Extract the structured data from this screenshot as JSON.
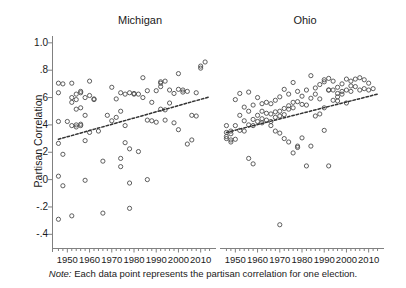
{
  "figure": {
    "width": 406,
    "height": 288,
    "background": "#ffffff",
    "marker_color": "#4d4d4d",
    "axis_color": "#808080",
    "fit_line_color": "#333333",
    "note_prefix": "Note:",
    "note_text": " Each data point represents the partisan correlation for one election."
  },
  "axes": {
    "y_title": "Partisan Correlation",
    "y_ticks": [
      "1.0",
      ".8",
      ".6",
      ".4",
      ".2",
      ".0",
      "-.2",
      "-.4"
    ],
    "y_tick_values": [
      1.0,
      0.8,
      0.6,
      0.4,
      0.2,
      0.0,
      -0.2,
      -0.4
    ],
    "y_range": [
      -0.5,
      1.05
    ],
    "x_ticks": [
      "1950",
      "1960",
      "1970",
      "1980",
      "1990",
      "2000",
      "2010"
    ],
    "x_tick_values": [
      1950,
      1960,
      1970,
      1980,
      1990,
      2000,
      2010
    ],
    "x_range": [
      1944,
      2016
    ],
    "x_minor_step": 2,
    "grid": false
  },
  "chart_data": {
    "type": "scatter",
    "title": "",
    "subtitle": "",
    "xlabel": "",
    "ylabel": "Partisan Correlation",
    "xlim": [
      1944,
      2016
    ],
    "ylim": [
      -0.5,
      1.05
    ],
    "grid": false,
    "legend": "none",
    "annotations": [
      "Note: Each data point represents the partisan correlation for one election."
    ],
    "panels": [
      {
        "name": "Michigan",
        "fit_line": {
          "type": "linear-dashed",
          "x": [
            1946,
            2014
          ],
          "y": [
            0.295,
            0.605
          ]
        },
        "points": [
          {
            "x": 1946,
            "y": 0.705
          },
          {
            "x": 1946,
            "y": 0.635
          },
          {
            "x": 1946,
            "y": 0.425
          },
          {
            "x": 1946,
            "y": 0.265
          },
          {
            "x": 1946,
            "y": 0.025
          },
          {
            "x": 1946,
            "y": -0.29
          },
          {
            "x": 1948,
            "y": 0.7
          },
          {
            "x": 1948,
            "y": 0.185
          },
          {
            "x": 1948,
            "y": -0.045
          },
          {
            "x": 1950,
            "y": 0.425
          },
          {
            "x": 1952,
            "y": 0.705
          },
          {
            "x": 1952,
            "y": 0.6
          },
          {
            "x": 1952,
            "y": 0.565
          },
          {
            "x": 1952,
            "y": 0.395
          },
          {
            "x": 1952,
            "y": -0.265
          },
          {
            "x": 1954,
            "y": 0.625
          },
          {
            "x": 1954,
            "y": 0.585
          },
          {
            "x": 1954,
            "y": 0.515
          },
          {
            "x": 1954,
            "y": 0.4
          },
          {
            "x": 1954,
            "y": 0.385
          },
          {
            "x": 1956,
            "y": 0.645
          },
          {
            "x": 1956,
            "y": 0.635
          },
          {
            "x": 1956,
            "y": 0.525
          },
          {
            "x": 1956,
            "y": 0.405
          },
          {
            "x": 1956,
            "y": 0.395
          },
          {
            "x": 1958,
            "y": 0.6
          },
          {
            "x": 1958,
            "y": 0.47
          },
          {
            "x": 1958,
            "y": 0.285
          },
          {
            "x": 1958,
            "y": -0.005
          },
          {
            "x": 1960,
            "y": 0.72
          },
          {
            "x": 1960,
            "y": 0.615
          },
          {
            "x": 1960,
            "y": 0.345
          },
          {
            "x": 1962,
            "y": 0.59
          },
          {
            "x": 1962,
            "y": 0.585
          },
          {
            "x": 1964,
            "y": 0.355
          },
          {
            "x": 1966,
            "y": 0.135
          },
          {
            "x": 1966,
            "y": -0.245
          },
          {
            "x": 1968,
            "y": 0.47
          },
          {
            "x": 1970,
            "y": 0.675
          },
          {
            "x": 1970,
            "y": 0.43
          },
          {
            "x": 1972,
            "y": 0.59
          },
          {
            "x": 1972,
            "y": 0.455
          },
          {
            "x": 1974,
            "y": 0.635
          },
          {
            "x": 1974,
            "y": 0.5
          },
          {
            "x": 1974,
            "y": 0.155
          },
          {
            "x": 1974,
            "y": 0.095
          },
          {
            "x": 1976,
            "y": 0.625
          },
          {
            "x": 1976,
            "y": 0.395
          },
          {
            "x": 1976,
            "y": 0.27
          },
          {
            "x": 1978,
            "y": 0.635
          },
          {
            "x": 1978,
            "y": 0.225
          },
          {
            "x": 1978,
            "y": -0.025
          },
          {
            "x": 1978,
            "y": -0.21
          },
          {
            "x": 1980,
            "y": 0.63
          },
          {
            "x": 1980,
            "y": 0.625
          },
          {
            "x": 1982,
            "y": 0.625
          },
          {
            "x": 1982,
            "y": 0.205
          },
          {
            "x": 1984,
            "y": 0.745
          },
          {
            "x": 1984,
            "y": 0.6
          },
          {
            "x": 1986,
            "y": 0.65
          },
          {
            "x": 1986,
            "y": 0.435
          },
          {
            "x": 1986,
            "y": 0.0
          },
          {
            "x": 1988,
            "y": 0.565
          },
          {
            "x": 1988,
            "y": 0.43
          },
          {
            "x": 1990,
            "y": 0.65
          },
          {
            "x": 1990,
            "y": 0.42
          },
          {
            "x": 1992,
            "y": 0.715
          },
          {
            "x": 1992,
            "y": 0.705
          },
          {
            "x": 1992,
            "y": 0.68
          },
          {
            "x": 1992,
            "y": 0.515
          },
          {
            "x": 1994,
            "y": 0.72
          },
          {
            "x": 1994,
            "y": 0.51
          },
          {
            "x": 1994,
            "y": 0.435
          },
          {
            "x": 1996,
            "y": 0.655
          },
          {
            "x": 1996,
            "y": 0.56
          },
          {
            "x": 1998,
            "y": 0.63
          },
          {
            "x": 1998,
            "y": 0.415
          },
          {
            "x": 2000,
            "y": 0.775
          },
          {
            "x": 2000,
            "y": 0.66
          },
          {
            "x": 2000,
            "y": 0.365
          },
          {
            "x": 2002,
            "y": 0.655
          },
          {
            "x": 2002,
            "y": 0.64
          },
          {
            "x": 2004,
            "y": 0.645
          },
          {
            "x": 2004,
            "y": 0.26
          },
          {
            "x": 2006,
            "y": 0.47
          },
          {
            "x": 2006,
            "y": 0.29
          },
          {
            "x": 2008,
            "y": 0.635
          },
          {
            "x": 2008,
            "y": 0.465
          },
          {
            "x": 2010,
            "y": 0.83
          },
          {
            "x": 2010,
            "y": 0.815
          },
          {
            "x": 2012,
            "y": 0.86
          }
        ]
      },
      {
        "name": "Ohio",
        "fit_line": {
          "type": "linear-dashed",
          "x": [
            1946,
            2014
          ],
          "y": [
            0.345,
            0.625
          ]
        },
        "points": [
          {
            "x": 1946,
            "y": 0.395
          },
          {
            "x": 1946,
            "y": 0.345
          },
          {
            "x": 1946,
            "y": 0.315
          },
          {
            "x": 1946,
            "y": 0.3
          },
          {
            "x": 1948,
            "y": 0.355
          },
          {
            "x": 1948,
            "y": 0.335
          },
          {
            "x": 1948,
            "y": 0.29
          },
          {
            "x": 1948,
            "y": 0.275
          },
          {
            "x": 1950,
            "y": 0.585
          },
          {
            "x": 1950,
            "y": 0.395
          },
          {
            "x": 1950,
            "y": 0.295
          },
          {
            "x": 1952,
            "y": 0.63
          },
          {
            "x": 1952,
            "y": 0.47
          },
          {
            "x": 1952,
            "y": 0.36
          },
          {
            "x": 1954,
            "y": 0.53
          },
          {
            "x": 1954,
            "y": 0.43
          },
          {
            "x": 1954,
            "y": 0.355
          },
          {
            "x": 1956,
            "y": 0.64
          },
          {
            "x": 1956,
            "y": 0.5
          },
          {
            "x": 1956,
            "y": 0.4
          },
          {
            "x": 1956,
            "y": 0.155
          },
          {
            "x": 1958,
            "y": 0.545
          },
          {
            "x": 1958,
            "y": 0.44
          },
          {
            "x": 1958,
            "y": 0.395
          },
          {
            "x": 1958,
            "y": 0.115
          },
          {
            "x": 1960,
            "y": 0.6
          },
          {
            "x": 1960,
            "y": 0.47
          },
          {
            "x": 1960,
            "y": 0.425
          },
          {
            "x": 1962,
            "y": 0.555
          },
          {
            "x": 1962,
            "y": 0.5
          },
          {
            "x": 1962,
            "y": 0.445
          },
          {
            "x": 1962,
            "y": 0.415
          },
          {
            "x": 1964,
            "y": 0.565
          },
          {
            "x": 1964,
            "y": 0.485
          },
          {
            "x": 1964,
            "y": 0.435
          },
          {
            "x": 1966,
            "y": 0.555
          },
          {
            "x": 1966,
            "y": 0.48
          },
          {
            "x": 1966,
            "y": 0.425
          },
          {
            "x": 1966,
            "y": 0.395
          },
          {
            "x": 1968,
            "y": 0.58
          },
          {
            "x": 1968,
            "y": 0.495
          },
          {
            "x": 1968,
            "y": 0.455
          },
          {
            "x": 1968,
            "y": 0.355
          },
          {
            "x": 1970,
            "y": 0.605
          },
          {
            "x": 1970,
            "y": 0.5
          },
          {
            "x": 1970,
            "y": 0.465
          },
          {
            "x": 1970,
            "y": 0.34
          },
          {
            "x": 1970,
            "y": -0.33
          },
          {
            "x": 1972,
            "y": 0.66
          },
          {
            "x": 1972,
            "y": 0.52
          },
          {
            "x": 1972,
            "y": 0.475
          },
          {
            "x": 1972,
            "y": 0.3
          },
          {
            "x": 1974,
            "y": 0.625
          },
          {
            "x": 1974,
            "y": 0.54
          },
          {
            "x": 1974,
            "y": 0.515
          },
          {
            "x": 1974,
            "y": 0.275
          },
          {
            "x": 1976,
            "y": 0.71
          },
          {
            "x": 1976,
            "y": 0.565
          },
          {
            "x": 1976,
            "y": 0.525
          },
          {
            "x": 1976,
            "y": 0.195
          },
          {
            "x": 1978,
            "y": 0.645
          },
          {
            "x": 1978,
            "y": 0.57
          },
          {
            "x": 1978,
            "y": 0.245
          },
          {
            "x": 1978,
            "y": 0.235
          },
          {
            "x": 1980,
            "y": 0.61
          },
          {
            "x": 1980,
            "y": 0.55
          },
          {
            "x": 1980,
            "y": 0.305
          },
          {
            "x": 1982,
            "y": 0.655
          },
          {
            "x": 1982,
            "y": 0.545
          },
          {
            "x": 1982,
            "y": 0.1
          },
          {
            "x": 1984,
            "y": 0.76
          },
          {
            "x": 1984,
            "y": 0.595
          },
          {
            "x": 1984,
            "y": 0.245
          },
          {
            "x": 1986,
            "y": 0.67
          },
          {
            "x": 1986,
            "y": 0.625
          },
          {
            "x": 1986,
            "y": 0.465
          },
          {
            "x": 1988,
            "y": 0.695
          },
          {
            "x": 1988,
            "y": 0.59
          },
          {
            "x": 1988,
            "y": 0.48
          },
          {
            "x": 1990,
            "y": 0.73
          },
          {
            "x": 1990,
            "y": 0.715
          },
          {
            "x": 1990,
            "y": 0.525
          },
          {
            "x": 1990,
            "y": 0.36
          },
          {
            "x": 1992,
            "y": 0.74
          },
          {
            "x": 1992,
            "y": 0.655
          },
          {
            "x": 1992,
            "y": 0.655
          },
          {
            "x": 1992,
            "y": 0.1
          },
          {
            "x": 1994,
            "y": 0.72
          },
          {
            "x": 1994,
            "y": 0.655
          },
          {
            "x": 1994,
            "y": 0.58
          },
          {
            "x": 1996,
            "y": 0.675
          },
          {
            "x": 1996,
            "y": 0.63
          },
          {
            "x": 1996,
            "y": 0.605
          },
          {
            "x": 1996,
            "y": 0.575
          },
          {
            "x": 1998,
            "y": 0.7
          },
          {
            "x": 1998,
            "y": 0.645
          },
          {
            "x": 1998,
            "y": 0.625
          },
          {
            "x": 2000,
            "y": 0.735
          },
          {
            "x": 2000,
            "y": 0.655
          },
          {
            "x": 2000,
            "y": 0.56
          },
          {
            "x": 2002,
            "y": 0.72
          },
          {
            "x": 2002,
            "y": 0.685
          },
          {
            "x": 2002,
            "y": 0.645
          },
          {
            "x": 2004,
            "y": 0.735
          },
          {
            "x": 2004,
            "y": 0.68
          },
          {
            "x": 2006,
            "y": 0.745
          },
          {
            "x": 2006,
            "y": 0.655
          },
          {
            "x": 2008,
            "y": 0.73
          },
          {
            "x": 2008,
            "y": 0.665
          },
          {
            "x": 2010,
            "y": 0.705
          },
          {
            "x": 2010,
            "y": 0.655
          },
          {
            "x": 2012,
            "y": 0.665
          }
        ]
      }
    ]
  }
}
